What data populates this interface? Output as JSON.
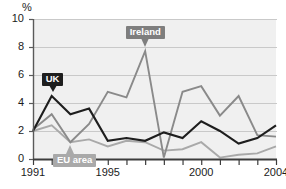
{
  "chart_data": {
    "type": "line",
    "title": "",
    "subtitle": "",
    "xlabel": "",
    "ylabel": "%",
    "unit_label": "%",
    "grid": true,
    "legend_position": "inline-callouts",
    "xlim": [
      1991,
      2004
    ],
    "ylim": [
      0,
      10
    ],
    "ytick_labels": [
      "0",
      "2",
      "4",
      "6",
      "8",
      "10"
    ],
    "ytick_values": [
      0,
      2,
      4,
      6,
      8,
      10
    ],
    "xtick_values": [
      1991,
      1992,
      1993,
      1994,
      1995,
      1996,
      1997,
      1998,
      1999,
      2000,
      2001,
      2002,
      2003,
      2004
    ],
    "xtick_labels_shown": [
      "1991",
      "1995",
      "2000",
      "2004"
    ],
    "xtick_labels_shown_values": [
      1991,
      1995,
      2000,
      2004
    ],
    "x": [
      1991,
      1992,
      1993,
      1994,
      1995,
      1996,
      1997,
      1998,
      1999,
      2000,
      2001,
      2002,
      2003,
      2004
    ],
    "series": [
      {
        "name": "UK",
        "color": "#1e1e1e",
        "values": [
          2.0,
          4.5,
          3.2,
          3.6,
          1.3,
          1.5,
          1.3,
          1.9,
          1.5,
          2.7,
          2.0,
          1.1,
          1.5,
          2.4
        ]
      },
      {
        "name": "Ireland",
        "color": "#8a8a8a",
        "values": [
          2.1,
          3.2,
          1.2,
          2.5,
          4.8,
          4.4,
          7.7,
          0.1,
          4.8,
          5.2,
          3.1,
          4.5,
          1.7,
          1.6
        ]
      },
      {
        "name": "EU area",
        "color": "#a9a9a9",
        "values": [
          2.0,
          2.4,
          1.2,
          1.4,
          0.9,
          1.3,
          1.2,
          0.6,
          0.7,
          1.2,
          0.1,
          0.3,
          0.4,
          0.9
        ]
      }
    ],
    "annotations": [
      {
        "label": "UK",
        "series": "UK",
        "anchor_year": 1992,
        "style": "dark-callout"
      },
      {
        "label": "Ireland",
        "series": "Ireland",
        "anchor_year": 1997,
        "style": "gray-callout"
      },
      {
        "label": "EU area",
        "series": "EU area",
        "anchor_year": 1993,
        "style": "light-gray-callout"
      }
    ]
  },
  "colors": {
    "uk": "#1e1e1e",
    "ireland": "#8a8a8a",
    "eu_area": "#a9a9a9",
    "plot_background": "#f0f0f0",
    "gridline": "#c9c9c9",
    "axis": "#5a5a5a",
    "text": "#1b1b1b"
  }
}
